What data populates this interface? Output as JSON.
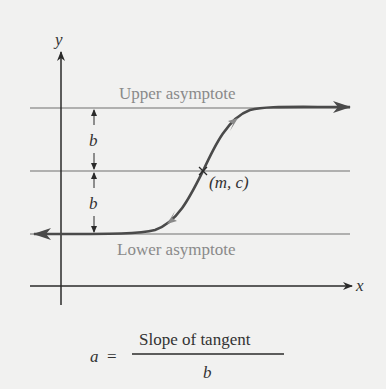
{
  "diagram": {
    "axes": {
      "x_label": "x",
      "y_label": "y"
    },
    "labels": {
      "upper_asymptote": "Upper asymptote",
      "lower_asymptote": "Lower asymptote",
      "midpoint": "(m, c)",
      "half_gap_top": "b",
      "half_gap_bottom": "b"
    },
    "formula": {
      "lhs": "a",
      "equals": "=",
      "numerator": "Slope of tangent",
      "denominator": "b"
    },
    "colors": {
      "background": "#f1f1f0",
      "axis": "#2a2a2a",
      "curve": "#4a4a4a",
      "asymptote_line": "#9a9a9a",
      "gray_text": "#8a8a8a",
      "tangent_arrow": "#8a8a8a"
    }
  }
}
